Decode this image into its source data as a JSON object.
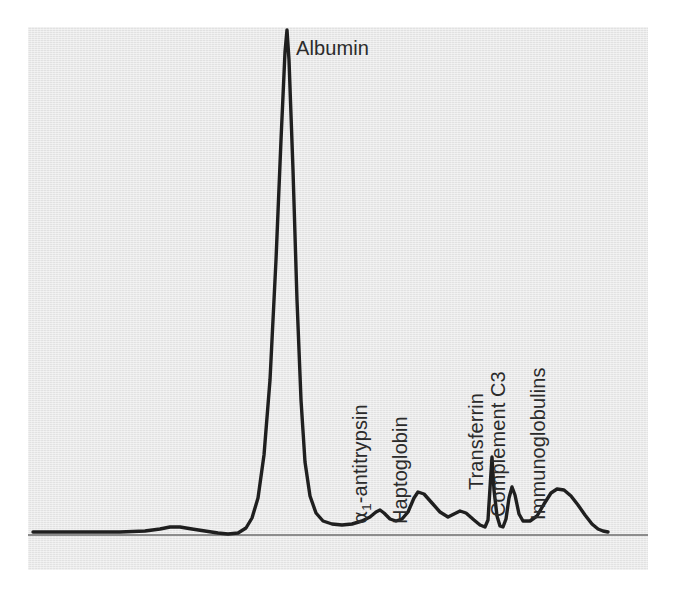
{
  "figure": {
    "type": "densitometry-scan",
    "background_color": "#e7e7e7",
    "page_color": "#ffffff",
    "trace_color": "#1f1f1f",
    "axis_color": "#8c8c8c",
    "label_color": "#2b2b2b"
  },
  "labels": {
    "albumin": "Albumin",
    "a1_antitrypsin_prefix": "α",
    "a1_antitrypsin_subscript": "1",
    "a1_antitrypsin_suffix": "-antitrypsin",
    "haptoglobin": "Haptoglobin",
    "transferrin": "Transferrin",
    "complement_c3": "Complement C3",
    "immunoglobulins": "Immunoglobulins"
  },
  "chart_data": {
    "type": "line",
    "xlabel": "",
    "ylabel": "",
    "grid": false,
    "legend": "none",
    "axis": {
      "baseline_y_px": 535,
      "baseline_x_start_px": 28,
      "baseline_x_end_px": 648,
      "note": "single horizontal baseline axis, no tick marks or numeric scale shown"
    },
    "xlim": [
      28,
      648
    ],
    "ylim": [
      0,
      1
    ],
    "annotations": [
      {
        "label": "Albumin",
        "peak_x_px": 287,
        "peak_y_px": 30,
        "relative_height": 1.0,
        "rotation_deg": 0
      },
      {
        "label": "α1-antitrypsin",
        "peak_x_px": 378,
        "peak_y_px": 510,
        "relative_height": 0.05,
        "rotation_deg": -90
      },
      {
        "label": "Haptoglobin",
        "peak_x_px": 417,
        "peak_y_px": 492,
        "relative_height": 0.085,
        "rotation_deg": -90
      },
      {
        "label": "Transferrin",
        "peak_x_px": 492,
        "peak_y_px": 457,
        "relative_height": 0.155,
        "rotation_deg": -90
      },
      {
        "label": "Complement C3",
        "peak_x_px": 513,
        "peak_y_px": 487,
        "relative_height": 0.095,
        "rotation_deg": -90
      },
      {
        "label": "Immunoglobulins",
        "peak_x_px": 555,
        "peak_y_px": 489,
        "relative_height": 0.092,
        "rotation_deg": -90
      }
    ],
    "series": [
      {
        "name": "absorbance",
        "points_px": [
          [
            33,
            532
          ],
          [
            60,
            532
          ],
          [
            90,
            532
          ],
          [
            120,
            532
          ],
          [
            145,
            531
          ],
          [
            160,
            529
          ],
          [
            170,
            527
          ],
          [
            180,
            527
          ],
          [
            192,
            529
          ],
          [
            205,
            531
          ],
          [
            218,
            533
          ],
          [
            228,
            534
          ],
          [
            238,
            533
          ],
          [
            246,
            528
          ],
          [
            252,
            518
          ],
          [
            258,
            498
          ],
          [
            264,
            455
          ],
          [
            270,
            380
          ],
          [
            276,
            260
          ],
          [
            281,
            140
          ],
          [
            285,
            52
          ],
          [
            287,
            30
          ],
          [
            289,
            60
          ],
          [
            293,
            170
          ],
          [
            297,
            300
          ],
          [
            301,
            400
          ],
          [
            305,
            462
          ],
          [
            310,
            496
          ],
          [
            316,
            513
          ],
          [
            323,
            521
          ],
          [
            332,
            524
          ],
          [
            342,
            525
          ],
          [
            352,
            524
          ],
          [
            362,
            521
          ],
          [
            370,
            517
          ],
          [
            376,
            512
          ],
          [
            380,
            510
          ],
          [
            384,
            513
          ],
          [
            390,
            519
          ],
          [
            396,
            521
          ],
          [
            402,
            519
          ],
          [
            408,
            512
          ],
          [
            414,
            498
          ],
          [
            418,
            492
          ],
          [
            424,
            494
          ],
          [
            432,
            503
          ],
          [
            440,
            512
          ],
          [
            448,
            517
          ],
          [
            454,
            514
          ],
          [
            460,
            511
          ],
          [
            466,
            513
          ],
          [
            474,
            520
          ],
          [
            480,
            525
          ],
          [
            485,
            527
          ],
          [
            488,
            520
          ],
          [
            490,
            488
          ],
          [
            492,
            457
          ],
          [
            494,
            490
          ],
          [
            497,
            516
          ],
          [
            500,
            526
          ],
          [
            503,
            527
          ],
          [
            506,
            519
          ],
          [
            509,
            498
          ],
          [
            512,
            487
          ],
          [
            515,
            495
          ],
          [
            519,
            514
          ],
          [
            523,
            521
          ],
          [
            530,
            521
          ],
          [
            537,
            516
          ],
          [
            544,
            504
          ],
          [
            551,
            493
          ],
          [
            557,
            489
          ],
          [
            564,
            490
          ],
          [
            571,
            496
          ],
          [
            578,
            505
          ],
          [
            585,
            515
          ],
          [
            592,
            524
          ],
          [
            598,
            529
          ],
          [
            603,
            531
          ],
          [
            608,
            532
          ]
        ]
      }
    ]
  }
}
